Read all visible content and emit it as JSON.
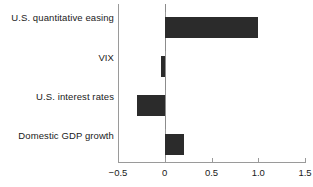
{
  "chart_data": {
    "type": "bar",
    "orientation": "horizontal",
    "title": "",
    "xlabel": "",
    "ylabel": "",
    "categories": [
      "U.S. quantitative easing",
      "VIX",
      "U.S. interest rates",
      "Domestic GDP growth"
    ],
    "values": [
      1.0,
      -0.04,
      -0.3,
      0.21
    ],
    "xlim": [
      -0.5,
      1.5
    ],
    "xticks": [
      -0.5,
      0,
      0.5,
      1.0,
      1.5
    ],
    "xticklabels": [
      "−0.5",
      "0",
      "0.5",
      "1.0",
      "1.5"
    ],
    "grid": false,
    "legend": false,
    "bar_color": "#2b2b2b",
    "axis_color": "#9a9a9a",
    "zero_line": 0
  },
  "axis": {
    "tick_labels": [
      "−0.5",
      "0",
      "0.5",
      "1.0",
      "1.5"
    ]
  },
  "categories": [
    {
      "label": "U.S. quantitative easing",
      "value": 1.0
    },
    {
      "label": "VIX",
      "value": -0.04
    },
    {
      "label": "U.S. interest rates",
      "value": -0.3
    },
    {
      "label": "Domestic GDP growth",
      "value": 0.21
    }
  ]
}
